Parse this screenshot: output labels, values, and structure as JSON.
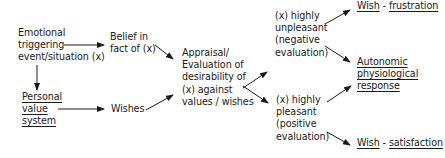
{
  "diagram": {
    "nodes": {
      "trigger": {
        "lines": [
          "Emotional",
          "triggering",
          "event/situation (x)"
        ]
      },
      "belief": {
        "lines": [
          "Belief in",
          "fact of (x)"
        ]
      },
      "personal": {
        "lines": [
          "Personal",
          "value",
          "system"
        ],
        "underlined": true
      },
      "wishes": {
        "lines": [
          "Wishes"
        ]
      },
      "appraisal": {
        "lines": [
          "Appraisal/",
          "Evaluation of",
          "desirability of",
          "(x) against",
          "values / wishes"
        ]
      },
      "unpleasant": {
        "lines": [
          "(x) highly",
          "unpleasant",
          "(negative",
          "evaluation)"
        ]
      },
      "pleasant": {
        "lines": [
          "(x) highly",
          "pleasant",
          "(positive",
          "evaluation)"
        ]
      },
      "frustration": {
        "part1": "Wish",
        "sep": " - ",
        "part2": "frustration",
        "underlined": true
      },
      "autonomic": {
        "lines": [
          "Autonomic",
          "physiological",
          "response"
        ],
        "underlined": true
      },
      "satisfaction": {
        "part1": "Wish",
        "sep": " - ",
        "part2": "satisfaction",
        "underlined": true
      }
    },
    "edges": [
      {
        "from": "trigger",
        "to": "belief"
      },
      {
        "from": "trigger",
        "to": "personal"
      },
      {
        "from": "personal",
        "to": "wishes"
      },
      {
        "from": "belief",
        "to": "appraisal"
      },
      {
        "from": "wishes",
        "to": "appraisal"
      },
      {
        "from": "appraisal",
        "to": "unpleasant"
      },
      {
        "from": "appraisal",
        "to": "pleasant"
      },
      {
        "from": "unpleasant",
        "to": "frustration"
      },
      {
        "from": "unpleasant",
        "to": "autonomic"
      },
      {
        "from": "pleasant",
        "to": "autonomic"
      },
      {
        "from": "pleasant",
        "to": "satisfaction"
      }
    ]
  }
}
